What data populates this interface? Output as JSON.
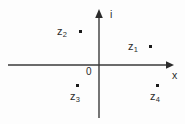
{
  "figure": {
    "kind": "complex-plane-diagram",
    "background_color": "#fdfdfd",
    "ink_color": "#2b2b2b",
    "axis_color": "#3a3a3a"
  },
  "axes": {
    "imaginary": {
      "label": "i",
      "label_x": 110,
      "label_y": 9,
      "line_x": 99,
      "top_y": 10,
      "bottom_y": 118,
      "arrow": "up"
    },
    "real": {
      "label": "x",
      "label_x": 172,
      "label_y": 70,
      "line_y": 65,
      "left_x": 8,
      "right_x": 173,
      "arrow": "right"
    },
    "origin": {
      "label": "0",
      "label_x": 86,
      "label_y": 67
    }
  },
  "points": [
    {
      "id": "z1",
      "label": "z",
      "subscript": "1",
      "dot_x": 150,
      "dot_y": 46,
      "label_x": 128,
      "label_y": 41,
      "dot_side": "right",
      "quadrant": "upper-right"
    },
    {
      "id": "z2",
      "label": "z",
      "subscript": "2",
      "dot_x": 80,
      "dot_y": 31,
      "label_x": 57,
      "label_y": 26,
      "dot_side": "right",
      "quadrant": "upper-left"
    },
    {
      "id": "z3",
      "label": "z",
      "subscript": "3",
      "dot_x": 77,
      "dot_y": 85,
      "label_x": 70,
      "label_y": 91,
      "dot_side": "above",
      "quadrant": "lower-left"
    },
    {
      "id": "z4",
      "label": "z",
      "subscript": "4",
      "dot_x": 157,
      "dot_y": 85,
      "label_x": 150,
      "label_y": 91,
      "dot_side": "above",
      "quadrant": "lower-right"
    }
  ]
}
